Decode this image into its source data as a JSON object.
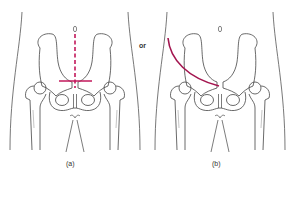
{
  "figure": {
    "connector_text": "or",
    "panels": [
      {
        "id": "a",
        "label": "(a)",
        "marker_color": "#c2185b",
        "marker_type": "dashed-vertical-and-horizontal-line"
      },
      {
        "id": "b",
        "label": "(b)",
        "marker_color": "#a3154f",
        "marker_type": "curved-line"
      }
    ],
    "colors": {
      "outline": "#444444",
      "accent": "#c2185b"
    }
  }
}
